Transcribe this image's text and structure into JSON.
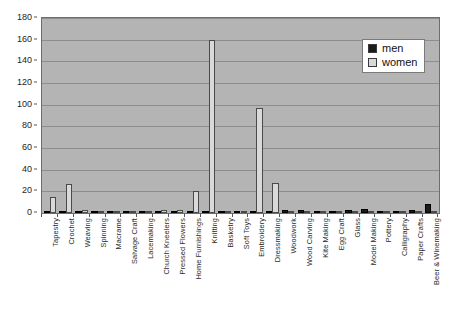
{
  "chart_data": {
    "type": "bar",
    "title": "",
    "subtitle": "",
    "xlabel": "",
    "ylabel": "",
    "ylim": [
      0,
      180
    ],
    "ytick_step": 20,
    "yticks": [
      0,
      20,
      40,
      60,
      80,
      100,
      120,
      140,
      160,
      180
    ],
    "grid": true,
    "legend_position": "top-right",
    "categories": [
      "Tapestry",
      "Crochet",
      "Weaving",
      "Spinning",
      "Macrame",
      "Salvage Craft",
      "Lacemaking",
      "Church Kneelers",
      "Pressed Flowers",
      "Home Furnishings",
      "Knitting",
      "Basketry",
      "Soft Toys",
      "Embroidery",
      "Dressmaking",
      "Woodwork",
      "Wood Carving",
      "Kite Making",
      "Egg Craft",
      "Glass",
      "Model Making",
      "Pottery",
      "Calligraphy",
      "Paper Crafts",
      "Beer & Winemaking"
    ],
    "series": [
      {
        "name": "men",
        "color": "#1c1c1c",
        "values": [
          1,
          1,
          1,
          1,
          1,
          1,
          1,
          1,
          1,
          1,
          2,
          1,
          1,
          1,
          1,
          3,
          3,
          2,
          2,
          3,
          4,
          2,
          2,
          3,
          8
        ]
      },
      {
        "name": "women",
        "color": "#d9d9d9",
        "values": [
          15,
          27,
          3,
          2,
          1,
          2,
          2,
          3,
          3,
          20,
          160,
          2,
          2,
          97,
          28,
          1,
          1,
          1,
          1,
          1,
          1,
          1,
          1,
          2,
          1
        ]
      }
    ]
  },
  "legend": {
    "items": [
      {
        "label": "men",
        "swatch": "men-swatch"
      },
      {
        "label": "women",
        "swatch": "women-swatch"
      }
    ]
  }
}
